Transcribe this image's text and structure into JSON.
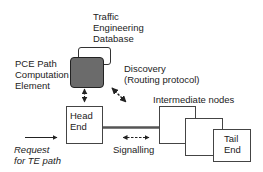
{
  "diagram": {
    "nodes": {
      "ted": {
        "line1": "Traffic",
        "line2": "Engineering",
        "line3": "Database"
      },
      "pce": {
        "line1": "PCE Path",
        "line2": "Computation",
        "line3": "Element"
      },
      "head_end": {
        "line1": "Head",
        "line2": "End"
      },
      "intermediate": {
        "label": "Intermediate nodes"
      },
      "tail_end": {
        "line1": "Tail",
        "line2": "End"
      }
    },
    "labels": {
      "discovery_line1": "Discovery",
      "discovery_line2": "(Routing protocol)",
      "signalling": "Signalling",
      "request_line1": "Request",
      "request_line2": "for TE path"
    },
    "colors": {
      "pce_fill": "#6b6b6b",
      "stroke": "#444444",
      "link": "#555555"
    }
  }
}
